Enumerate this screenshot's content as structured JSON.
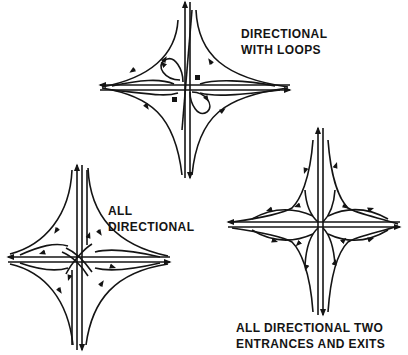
{
  "figure": {
    "background": "#ffffff",
    "ink_color": "#141414",
    "interchanges": [
      {
        "id": "directional-with-loops",
        "label_lines": [
          "DIRECTIONAL",
          "WITH LOOPS"
        ],
        "center": [
          187,
          75
        ],
        "features": [
          "two loop ramps",
          "directional ramps",
          "four-legged cross"
        ]
      },
      {
        "id": "all-directional",
        "label_lines": [
          "ALL",
          "DIRECTIONAL"
        ],
        "center": [
          78,
          258
        ],
        "features": [
          "directional ramps",
          "crossover flyovers at center"
        ]
      },
      {
        "id": "all-directional-two-entrances-exits",
        "label_lines": [
          "ALL DIRECTIONAL TWO",
          "ENTRANCES AND EXITS"
        ],
        "center": [
          320,
          225
        ],
        "features": [
          "two entrances and exits per direction",
          "directional ramps"
        ]
      }
    ]
  }
}
